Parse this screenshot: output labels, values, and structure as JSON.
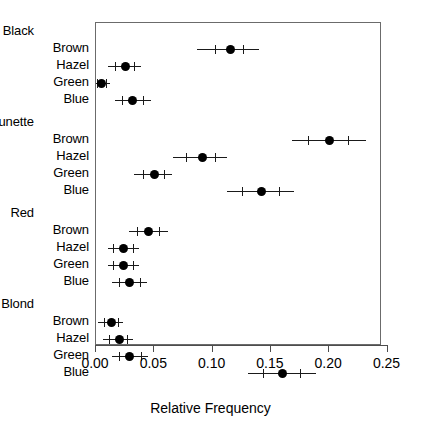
{
  "chart_data": {
    "type": "scatter",
    "title": "",
    "subtitle": "",
    "xlabel": "Relative Frequency",
    "ylabel": "",
    "xlim": [
      -0.005,
      0.2555
    ],
    "grid": false,
    "legend": null,
    "orientation": "horizontal",
    "marker": "filled-circle-with-error-bars",
    "xticks": [
      0.0,
      0.05,
      0.1,
      0.15,
      0.2,
      0.25
    ],
    "xticklabels": [
      "0.00",
      "0.05",
      "0.10",
      "0.15",
      "0.20",
      "0.25"
    ],
    "groups": [
      {
        "name": "Black",
        "rows": [
          {
            "label": "Brown",
            "value": 0.115,
            "lo": 0.087,
            "hi": 0.14,
            "inner_lo": 0.102,
            "inner_hi": 0.126
          },
          {
            "label": "Hazel",
            "value": 0.025,
            "lo": 0.01,
            "hi": 0.039,
            "inner_lo": 0.016,
            "inner_hi": 0.033
          },
          {
            "label": "Green",
            "value": 0.005,
            "lo": -0.002,
            "hi": 0.012,
            "inner_lo": 0.001,
            "inner_hi": 0.009
          },
          {
            "label": "Blue",
            "value": 0.031,
            "lo": 0.016,
            "hi": 0.047,
            "inner_lo": 0.022,
            "inner_hi": 0.04
          }
        ]
      },
      {
        "name": "Brunette",
        "rows": [
          {
            "label": "Brown",
            "value": 0.2,
            "lo": 0.168,
            "hi": 0.232,
            "inner_lo": 0.182,
            "inner_hi": 0.216
          },
          {
            "label": "Hazel",
            "value": 0.091,
            "lo": 0.066,
            "hi": 0.112,
            "inner_lo": 0.077,
            "inner_hi": 0.102
          },
          {
            "label": "Green",
            "value": 0.05,
            "lo": 0.033,
            "hi": 0.065,
            "inner_lo": 0.04,
            "inner_hi": 0.058
          },
          {
            "label": "Blue",
            "value": 0.142,
            "lo": 0.112,
            "hi": 0.17,
            "inner_lo": 0.125,
            "inner_hi": 0.157
          }
        ]
      },
      {
        "name": "Red",
        "rows": [
          {
            "label": "Brown",
            "value": 0.045,
            "lo": 0.028,
            "hi": 0.062,
            "inner_lo": 0.035,
            "inner_hi": 0.054
          },
          {
            "label": "Hazel",
            "value": 0.024,
            "lo": 0.01,
            "hi": 0.037,
            "inner_lo": 0.015,
            "inner_hi": 0.032
          },
          {
            "label": "Green",
            "value": 0.024,
            "lo": 0.01,
            "hi": 0.037,
            "inner_lo": 0.015,
            "inner_hi": 0.032
          },
          {
            "label": "Blue",
            "value": 0.029,
            "lo": 0.014,
            "hi": 0.044,
            "inner_lo": 0.02,
            "inner_hi": 0.038
          }
        ]
      },
      {
        "name": "Blond",
        "rows": [
          {
            "label": "Brown",
            "value": 0.013,
            "lo": 0.002,
            "hi": 0.023,
            "inner_lo": 0.007,
            "inner_hi": 0.019
          },
          {
            "label": "Hazel",
            "value": 0.02,
            "lo": 0.006,
            "hi": 0.032,
            "inner_lo": 0.011,
            "inner_hi": 0.027
          },
          {
            "label": "Green",
            "value": 0.029,
            "lo": 0.014,
            "hi": 0.045,
            "inner_lo": 0.02,
            "inner_hi": 0.039
          },
          {
            "label": "Blue",
            "value": 0.16,
            "lo": 0.13,
            "hi": 0.189,
            "inner_lo": 0.143,
            "inner_hi": 0.175
          }
        ]
      }
    ]
  },
  "colors": {
    "marker": "#000000",
    "error_bar": "#1a1a1a",
    "frame": "#6b6b6b",
    "axis": "#4d4d4d",
    "background": "#ffffff"
  }
}
